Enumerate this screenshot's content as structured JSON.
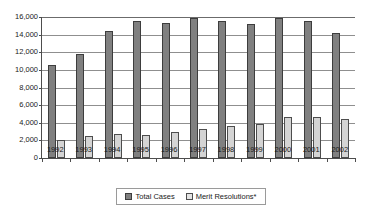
{
  "chart_data": {
    "type": "bar",
    "title": "",
    "xlabel": "",
    "ylabel": "",
    "ylim": [
      0,
      16000
    ],
    "ytick_labels": [
      "16,000",
      "14,000",
      "12,000",
      "10,000",
      "8,000",
      "6,000",
      "4,000",
      "2,000",
      "0"
    ],
    "ytick_values": [
      16000,
      14000,
      12000,
      10000,
      8000,
      6000,
      4000,
      2000,
      0
    ],
    "grid": true,
    "legend_position": "bottom-center",
    "categories": [
      "1992",
      "1993",
      "1994",
      "1995",
      "1996",
      "1997",
      "1998",
      "1999",
      "2000",
      "2001",
      "2002"
    ],
    "series": [
      {
        "name": "Total Cases",
        "color": "#808080",
        "values": [
          10500,
          11800,
          14400,
          15600,
          15300,
          15900,
          15600,
          15200,
          15900,
          15500,
          14200
        ]
      },
      {
        "name": "Merit Resolutions*",
        "color": "#d4d4d4",
        "values": [
          2000,
          2500,
          2700,
          2600,
          2900,
          3300,
          3600,
          3900,
          4600,
          4600,
          4400
        ]
      }
    ]
  },
  "legend": {
    "items": [
      {
        "label": "Total Cases"
      },
      {
        "label": "Merit Resolutions*"
      }
    ]
  },
  "colors": {
    "total_cases": "#808080",
    "merit_resolutions": "#d4d4d4",
    "axis": "#4d4d4d",
    "gridline": "#8f8f8f",
    "background": "#ffffff",
    "text": "#1a1a1a"
  }
}
